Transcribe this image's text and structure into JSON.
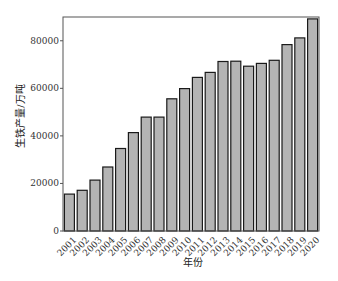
{
  "chart_data": {
    "type": "bar",
    "title": "",
    "xlabel": "年份",
    "ylabel": "生铁产量/万吨",
    "categories": [
      "2001",
      "2002",
      "2003",
      "2004",
      "2005",
      "2006",
      "2007",
      "2008",
      "2009",
      "2010",
      "2011",
      "2012",
      "2013",
      "2014",
      "2015",
      "2016",
      "2017",
      "2018",
      "2019",
      "2020"
    ],
    "values": [
      15500,
      17100,
      21400,
      26900,
      34700,
      41400,
      47900,
      47900,
      55600,
      59900,
      64600,
      66700,
      71300,
      71400,
      69300,
      70500,
      71800,
      78400,
      81200,
      89200
    ],
    "ylim": [
      0,
      90000
    ],
    "yticks": [
      0,
      20000,
      40000,
      60000,
      80000
    ],
    "ytick_labels": [
      "0",
      "20000",
      "40000",
      "60000",
      "80000"
    ],
    "grid": false,
    "legend": null,
    "bar_color": "#b4b4b4",
    "bar_edge_color": "#1a1a1a"
  }
}
